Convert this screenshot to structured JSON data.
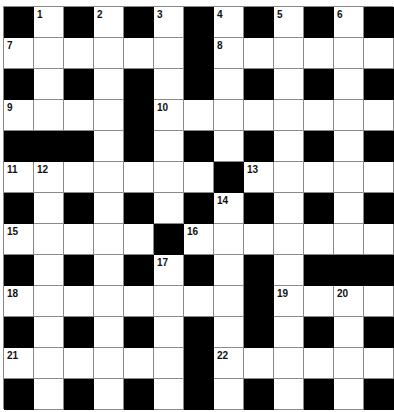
{
  "puzzle": {
    "rows": 13,
    "cols": 13,
    "colors": {
      "block": "#000000",
      "cell": "#ffffff",
      "gridline": "#8a8a8a",
      "number": "#111111"
    },
    "layout": [
      "#.#.#.#.#.#.#",
      "......#......",
      "#.#.#.#.#.#.#",
      "....#........",
      "###.#.#.#.#.#",
      ".......#.....",
      "#.#.#.#.#.#.#",
      ".....#.......",
      "#.#.#.#.#.###",
      "........#....",
      "#.#.#.#.#.#.#",
      "......#......",
      "#.#.#.#.#.#.#"
    ],
    "numbers": [
      {
        "row": 0,
        "col": 1,
        "n": "1"
      },
      {
        "row": 0,
        "col": 3,
        "n": "2"
      },
      {
        "row": 0,
        "col": 5,
        "n": "3"
      },
      {
        "row": 0,
        "col": 7,
        "n": "4"
      },
      {
        "row": 0,
        "col": 9,
        "n": "5"
      },
      {
        "row": 0,
        "col": 11,
        "n": "6"
      },
      {
        "row": 1,
        "col": 0,
        "n": "7"
      },
      {
        "row": 1,
        "col": 7,
        "n": "8"
      },
      {
        "row": 3,
        "col": 0,
        "n": "9"
      },
      {
        "row": 3,
        "col": 5,
        "n": "10"
      },
      {
        "row": 5,
        "col": 0,
        "n": "11"
      },
      {
        "row": 5,
        "col": 1,
        "n": "12"
      },
      {
        "row": 5,
        "col": 8,
        "n": "13"
      },
      {
        "row": 6,
        "col": 7,
        "n": "14"
      },
      {
        "row": 7,
        "col": 0,
        "n": "15"
      },
      {
        "row": 7,
        "col": 6,
        "n": "16"
      },
      {
        "row": 8,
        "col": 5,
        "n": "17"
      },
      {
        "row": 9,
        "col": 0,
        "n": "18"
      },
      {
        "row": 9,
        "col": 9,
        "n": "19"
      },
      {
        "row": 9,
        "col": 11,
        "n": "20"
      },
      {
        "row": 11,
        "col": 0,
        "n": "21"
      },
      {
        "row": 11,
        "col": 7,
        "n": "22"
      }
    ]
  }
}
